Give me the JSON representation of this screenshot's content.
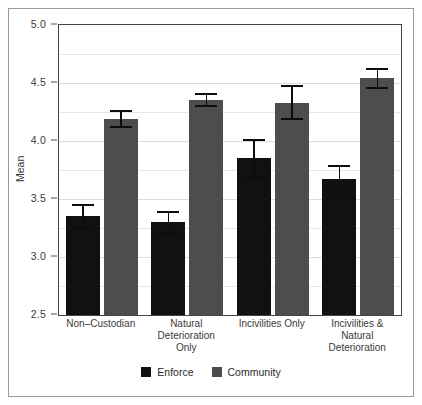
{
  "chart_data": {
    "type": "bar",
    "title": "",
    "xlabel": "",
    "ylabel": "Mean",
    "ylim": [
      2.5,
      5.0
    ],
    "ytick_values": [
      2.5,
      3.0,
      3.5,
      4.0,
      4.5,
      5.0
    ],
    "ytick_labels": [
      "2.5",
      "3.0",
      "3.5",
      "4.0",
      "4.5",
      "5.0"
    ],
    "yminor_values": [
      2.75,
      3.25,
      3.75,
      4.25,
      4.75
    ],
    "grid": true,
    "legend_position": "bottom",
    "categories": [
      "Non–Custodian",
      "Natural Deterioration\nOnly",
      "Incivilities Only",
      "Incivilities &\nNatural Deterioration"
    ],
    "series": [
      {
        "name": "Enforce",
        "color": "#111111",
        "values": [
          3.35,
          3.3,
          3.85,
          3.67
        ],
        "errors": [
          0.11,
          0.1,
          0.17,
          0.12
        ]
      },
      {
        "name": "Community",
        "color": "#4d4d4d",
        "values": [
          4.19,
          4.35,
          4.33,
          4.54
        ],
        "errors": [
          0.08,
          0.06,
          0.15,
          0.09
        ]
      }
    ]
  },
  "axis": {
    "y_title": "Mean"
  },
  "legend": {
    "items": [
      {
        "label": "Enforce",
        "color": "#111111",
        "swatch_name": "legend-swatch-enforce"
      },
      {
        "label": "Community",
        "color": "#4d4d4d",
        "swatch_name": "legend-swatch-community"
      }
    ]
  }
}
